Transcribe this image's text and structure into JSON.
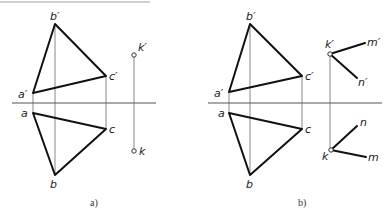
{
  "header_text_cutoff": "",
  "figures": [
    {
      "id": "a",
      "caption": "a)",
      "labels": {
        "a_prime": "a′",
        "b_prime": "b′",
        "c_prime": "c′",
        "k_prime": "k′",
        "a": "a",
        "b": "b",
        "c": "c",
        "k": "k"
      },
      "points": {
        "a_prime": [
          33,
          93
        ],
        "b_prime": [
          55,
          24
        ],
        "c_prime": [
          106,
          76
        ],
        "k_prime": [
          134,
          55
        ],
        "a": [
          33,
          113
        ],
        "b": [
          55,
          175
        ],
        "c": [
          106,
          129
        ],
        "k": [
          134,
          151
        ]
      },
      "axis": [
        12,
        103,
        156,
        103
      ]
    },
    {
      "id": "b",
      "caption": "b)",
      "labels": {
        "a_prime": "a′",
        "b_prime": "b′",
        "c_prime": "c′",
        "k_prime": "k′",
        "m_prime": "m′",
        "n_prime": "n′",
        "a": "a",
        "b": "b",
        "c": "c",
        "k": "k",
        "m": "m",
        "n": "n"
      },
      "points": {
        "a_prime": [
          229,
          92
        ],
        "b_prime": [
          250,
          24
        ],
        "c_prime": [
          302,
          76
        ],
        "k_prime": [
          330,
          54
        ],
        "m_prime": [
          365,
          43
        ],
        "n_prime": [
          357,
          78
        ],
        "a": [
          229,
          113
        ],
        "b": [
          250,
          175
        ],
        "c": [
          302,
          129
        ],
        "k": [
          331,
          150
        ],
        "m": [
          366,
          157
        ],
        "n": [
          357,
          126
        ]
      },
      "axis": [
        208,
        103,
        382,
        103
      ]
    }
  ]
}
